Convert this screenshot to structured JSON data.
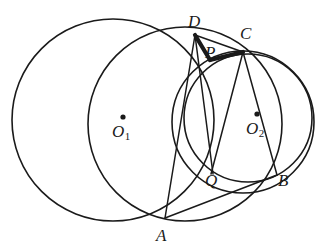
{
  "figure": {
    "type": "geometry-diagram",
    "width": 333,
    "height": 252,
    "background_color": "#ffffff",
    "stroke_color": "#1a1a1a"
  },
  "circles": [
    {
      "name": "circle-o1",
      "center_label": "O",
      "center_subscript": "1",
      "cx": 113,
      "cy": 120,
      "r": 101,
      "stroke_width": 1.6
    },
    {
      "name": "circle-middle",
      "center_label": "",
      "center_subscript": "",
      "cx": 185,
      "cy": 124,
      "r": 97,
      "stroke_width": 1.6
    },
    {
      "name": "circle-o2",
      "center_label": "O",
      "center_subscript": "2",
      "cx": 248,
      "cy": 118,
      "r": 64,
      "stroke_width": 1.6
    },
    {
      "name": "circle-right-outer",
      "center_label": "",
      "center_subscript": "",
      "cx": 243,
      "cy": 122,
      "r": 71,
      "stroke_width": 1.6
    }
  ],
  "points": [
    {
      "name": "point-d",
      "label": "D",
      "x": 195,
      "y": 35,
      "label_x": 188,
      "label_y": 13,
      "dot": false
    },
    {
      "name": "point-c",
      "label": "C",
      "x": 243,
      "y": 52,
      "label_x": 240,
      "label_y": 25,
      "dot": false
    },
    {
      "name": "point-p",
      "label": "P",
      "x": 208,
      "y": 56,
      "label_x": 205,
      "label_y": 44,
      "dot": false
    },
    {
      "name": "point-q",
      "label": "Q",
      "x": 212,
      "y": 173,
      "label_x": 205,
      "label_y": 172,
      "dot": false
    },
    {
      "name": "point-a",
      "label": "A",
      "x": 165,
      "y": 218,
      "label_x": 156,
      "label_y": 227,
      "dot": false
    },
    {
      "name": "point-b",
      "label": "B",
      "x": 277,
      "y": 175,
      "label_x": 278,
      "label_y": 172,
      "dot": false
    },
    {
      "name": "center-o1",
      "label": "O",
      "subscript": "1",
      "x": 123,
      "y": 117,
      "label_x": 112,
      "label_y": 123,
      "dot": true
    },
    {
      "name": "center-o2",
      "label": "O",
      "subscript": "2",
      "x": 257,
      "y": 114,
      "label_x": 246,
      "label_y": 120,
      "dot": true
    }
  ],
  "segments": [
    {
      "name": "segment-d-p",
      "x1": 195,
      "y1": 35,
      "x2": 210,
      "y2": 60,
      "stroke_width": 4.2,
      "emphasis": "thick"
    },
    {
      "name": "segment-p-c",
      "x1": 210,
      "y1": 60,
      "x2": 243,
      "y2": 52,
      "stroke_width": 4.2,
      "emphasis": "thick"
    },
    {
      "name": "segment-d-c",
      "x1": 195,
      "y1": 35,
      "x2": 243,
      "y2": 52,
      "stroke_width": 1.5,
      "emphasis": "thin"
    },
    {
      "name": "segment-d-q",
      "x1": 195,
      "y1": 35,
      "x2": 213,
      "y2": 174,
      "stroke_width": 1.5,
      "emphasis": "thin"
    },
    {
      "name": "segment-c-q",
      "x1": 243,
      "y1": 52,
      "x2": 211,
      "y2": 174,
      "stroke_width": 1.5,
      "emphasis": "thin"
    },
    {
      "name": "segment-d-a",
      "x1": 195,
      "y1": 35,
      "x2": 165,
      "y2": 218,
      "stroke_width": 1.5,
      "emphasis": "thin"
    },
    {
      "name": "segment-a-b",
      "x1": 165,
      "y1": 218,
      "x2": 277,
      "y2": 175,
      "stroke_width": 1.5,
      "emphasis": "thin"
    },
    {
      "name": "segment-c-b",
      "x1": 243,
      "y1": 52,
      "x2": 277,
      "y2": 175,
      "stroke_width": 1.5,
      "emphasis": "thin"
    }
  ]
}
